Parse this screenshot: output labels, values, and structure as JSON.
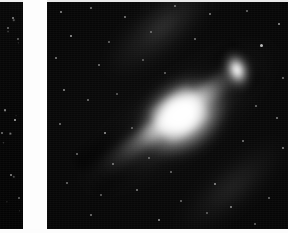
{
  "document": {
    "kind": "astronomical-photographic-plate-scan",
    "panel_count": 2,
    "background_color": "#ffffff",
    "sky_color": "#050505"
  },
  "panels": [
    {
      "id": "left-panel",
      "name": "left-plate-fragment",
      "description": "Narrow cropped strip of an adjacent photographic plate showing empty star field",
      "x": 0,
      "y": 2,
      "width": 23,
      "height": 227
    },
    {
      "id": "gutter",
      "name": "plate-gutter",
      "description": "White paper gap separating the two plate reproductions",
      "x": 23,
      "y": 0,
      "width": 24,
      "height": 233,
      "color": "#fdfdfd"
    },
    {
      "id": "main-panel",
      "name": "main-plate",
      "description": "Photographic plate of a large inclined spiral galaxy with a bright nuclear bulge, dust lanes and a companion elliptical galaxy",
      "x": 47,
      "y": 2,
      "width": 241,
      "height": 227
    }
  ],
  "objects": {
    "spiral_galaxy": {
      "name": "spiral-galaxy",
      "position_angle_deg": -36,
      "center_x": 136,
      "center_y": 115,
      "major_axis": 214,
      "minor_axis": 58,
      "core_brightness": "saturated-white"
    },
    "companion_galaxy": {
      "name": "companion-elliptical-galaxy",
      "center_x": 190,
      "center_y": 68,
      "width": 16,
      "height": 23,
      "position_angle_deg": -18
    },
    "bright_star": {
      "name": "bright-foreground-star",
      "center_x": 138,
      "center_y": 110
    },
    "dust_lanes": [
      {
        "name": "dust-lane-inner",
        "side": "north-east"
      },
      {
        "name": "dust-lane-outer",
        "side": "north-east"
      }
    ]
  },
  "stars_main": [
    {
      "x": 14,
      "y": 10,
      "r": 1.0,
      "o": 0.55
    },
    {
      "x": 44,
      "y": 6,
      "r": 0.9,
      "o": 0.45
    },
    {
      "x": 78,
      "y": 15,
      "r": 1.1,
      "o": 0.5
    },
    {
      "x": 128,
      "y": 4,
      "r": 0.8,
      "o": 0.4
    },
    {
      "x": 163,
      "y": 12,
      "r": 1.0,
      "o": 0.48
    },
    {
      "x": 200,
      "y": 9,
      "r": 0.9,
      "o": 0.42
    },
    {
      "x": 232,
      "y": 22,
      "r": 1.2,
      "o": 0.6
    },
    {
      "x": 24,
      "y": 34,
      "r": 1.3,
      "o": 0.62
    },
    {
      "x": 62,
      "y": 40,
      "r": 0.9,
      "o": 0.4
    },
    {
      "x": 104,
      "y": 30,
      "r": 0.8,
      "o": 0.35
    },
    {
      "x": 148,
      "y": 37,
      "r": 1.0,
      "o": 0.45
    },
    {
      "x": 214,
      "y": 43,
      "r": 1.5,
      "o": 0.72
    },
    {
      "x": 9,
      "y": 56,
      "r": 1.1,
      "o": 0.5
    },
    {
      "x": 52,
      "y": 63,
      "r": 1.0,
      "o": 0.47
    },
    {
      "x": 96,
      "y": 58,
      "r": 0.8,
      "o": 0.33
    },
    {
      "x": 118,
      "y": 71,
      "r": 0.9,
      "o": 0.38
    },
    {
      "x": 236,
      "y": 76,
      "r": 1.0,
      "o": 0.44
    },
    {
      "x": 17,
      "y": 88,
      "r": 1.2,
      "o": 0.55
    },
    {
      "x": 41,
      "y": 98,
      "r": 1.0,
      "o": 0.46
    },
    {
      "x": 70,
      "y": 92,
      "r": 0.8,
      "o": 0.34
    },
    {
      "x": 209,
      "y": 104,
      "r": 1.0,
      "o": 0.44
    },
    {
      "x": 230,
      "y": 116,
      "r": 1.1,
      "o": 0.5
    },
    {
      "x": 13,
      "y": 122,
      "r": 1.0,
      "o": 0.45
    },
    {
      "x": 58,
      "y": 131,
      "r": 1.3,
      "o": 0.6
    },
    {
      "x": 85,
      "y": 126,
      "r": 0.9,
      "o": 0.38
    },
    {
      "x": 196,
      "y": 139,
      "r": 1.1,
      "o": 0.48
    },
    {
      "x": 236,
      "y": 146,
      "r": 1.2,
      "o": 0.52
    },
    {
      "x": 30,
      "y": 152,
      "r": 1.0,
      "o": 0.44
    },
    {
      "x": 66,
      "y": 162,
      "r": 1.1,
      "o": 0.48
    },
    {
      "x": 102,
      "y": 156,
      "r": 0.9,
      "o": 0.38
    },
    {
      "x": 124,
      "y": 170,
      "r": 1.0,
      "o": 0.42
    },
    {
      "x": 168,
      "y": 182,
      "r": 1.2,
      "o": 0.55
    },
    {
      "x": 20,
      "y": 181,
      "r": 1.0,
      "o": 0.44
    },
    {
      "x": 54,
      "y": 193,
      "r": 0.9,
      "o": 0.37
    },
    {
      "x": 90,
      "y": 188,
      "r": 1.1,
      "o": 0.47
    },
    {
      "x": 134,
      "y": 199,
      "r": 1.0,
      "o": 0.42
    },
    {
      "x": 184,
      "y": 205,
      "r": 1.2,
      "o": 0.53
    },
    {
      "x": 222,
      "y": 196,
      "r": 1.0,
      "o": 0.42
    },
    {
      "x": 44,
      "y": 213,
      "r": 1.1,
      "o": 0.47
    },
    {
      "x": 112,
      "y": 218,
      "r": 1.3,
      "o": 0.58
    },
    {
      "x": 160,
      "y": 211,
      "r": 0.9,
      "o": 0.36
    },
    {
      "x": 208,
      "y": 222,
      "r": 1.0,
      "o": 0.4
    }
  ],
  "stars_left": [
    {
      "x": 13,
      "y": 16,
      "r": 1.1,
      "o": 0.55
    },
    {
      "x": 8,
      "y": 26,
      "r": 0.9,
      "o": 0.42
    },
    {
      "x": 18,
      "y": 37,
      "r": 0.8,
      "o": 0.34
    },
    {
      "x": 5,
      "y": 108,
      "r": 1.1,
      "o": 0.5
    },
    {
      "x": 15,
      "y": 118,
      "r": 1.4,
      "o": 0.68
    },
    {
      "x": 2,
      "y": 131,
      "r": 1.0,
      "o": 0.45
    },
    {
      "x": 11,
      "y": 173,
      "r": 1.2,
      "o": 0.55
    },
    {
      "x": 19,
      "y": 196,
      "r": 0.9,
      "o": 0.38
    }
  ]
}
